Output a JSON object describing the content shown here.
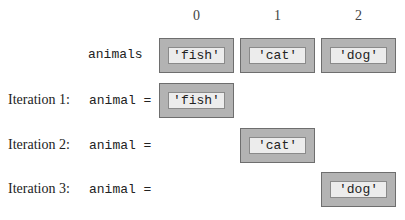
{
  "indices": [
    "0",
    "1",
    "2"
  ],
  "list": {
    "name": "animals",
    "items": [
      "'fish'",
      "'cat'",
      "'dog'"
    ]
  },
  "iterations": [
    {
      "label": "Iteration 1:",
      "var": "animal =",
      "value": "'fish'",
      "index": 0
    },
    {
      "label": "Iteration 2:",
      "var": "animal =",
      "value": "'cat'",
      "index": 1
    },
    {
      "label": "Iteration 3:",
      "var": "animal =",
      "value": "'dog'",
      "index": 2
    }
  ],
  "colors": {
    "outer_box": "#b3b3b3",
    "inner_box": "#ececec",
    "border": "#6e6e6e"
  }
}
